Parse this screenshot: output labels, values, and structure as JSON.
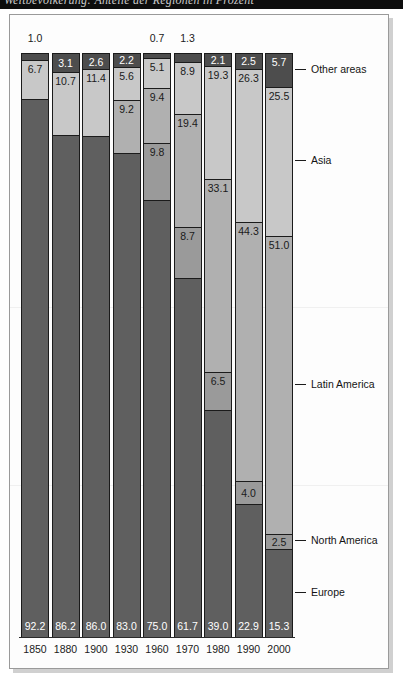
{
  "top_banner": {
    "partial_text": "Weltbevölkerung: Anteile der Regionen in Prozent"
  },
  "chart_data": {
    "type": "bar",
    "subtype": "stacked-bar-100-percent",
    "title": "",
    "xlabel": "",
    "ylabel": "",
    "ylim": [
      0,
      100
    ],
    "grid": false,
    "legend_position": "right-callouts",
    "categories": [
      "1850",
      "1880",
      "1900",
      "1930",
      "1960",
      "1970",
      "1980",
      "1990",
      "2000"
    ],
    "series": [
      {
        "name": "Other areas",
        "color": "#4d4d4d",
        "values": [
          1.0,
          3.1,
          2.6,
          2.2,
          0.7,
          1.3,
          2.1,
          2.5,
          5.7
        ]
      },
      {
        "name": "Asia",
        "color": "#c8c8c8",
        "values": [
          6.7,
          10.7,
          11.4,
          5.6,
          5.1,
          8.9,
          19.3,
          26.3,
          25.5
        ]
      },
      {
        "name": "Latin America",
        "color": "#b0b0b0",
        "values": [
          0.0,
          0.0,
          0.0,
          9.2,
          9.4,
          19.4,
          33.1,
          44.3,
          51.0
        ]
      },
      {
        "name": "North America",
        "color": "#9a9a9a",
        "values": [
          0.0,
          0.0,
          0.0,
          0.0,
          9.8,
          8.7,
          6.5,
          4.0,
          2.5
        ]
      },
      {
        "name": "Europe",
        "color": "#5f5f5f",
        "values": [
          92.2,
          86.2,
          86.0,
          83.0,
          75.0,
          61.7,
          39.0,
          22.9,
          15.3
        ]
      }
    ],
    "legend_entries": [
      {
        "label": "Other areas",
        "value": "5.7"
      },
      {
        "label": "Asia",
        "value": "25.5"
      },
      {
        "label": "Latin America",
        "value": "51.0"
      },
      {
        "label": "North America",
        "value": "2.5"
      },
      {
        "label": "Europe",
        "value": "15.3"
      }
    ],
    "bars": [
      {
        "year": "1850",
        "segments": [
          {
            "region": "Other areas",
            "value": 1.0,
            "label": "1.0",
            "shown": "above"
          },
          {
            "region": "Asia",
            "value": 6.7,
            "label": "6.7",
            "shown": "inside"
          },
          {
            "region": "Europe",
            "value": 92.2,
            "label": "92.2",
            "shown": "bottom"
          }
        ]
      },
      {
        "year": "1880",
        "segments": [
          {
            "region": "Other areas",
            "value": 3.1,
            "label": "3.1",
            "shown": "inside"
          },
          {
            "region": "Asia",
            "value": 10.7,
            "label": "10.7",
            "shown": "inside"
          },
          {
            "region": "Europe",
            "value": 86.2,
            "label": "86.2",
            "shown": "bottom"
          }
        ]
      },
      {
        "year": "1900",
        "segments": [
          {
            "region": "Other areas",
            "value": 2.6,
            "label": "2.6",
            "shown": "inside"
          },
          {
            "region": "Asia",
            "value": 11.4,
            "label": "11.4",
            "shown": "inside"
          },
          {
            "region": "Europe",
            "value": 86.0,
            "label": "86.0",
            "shown": "bottom"
          }
        ]
      },
      {
        "year": "1930",
        "segments": [
          {
            "region": "Other areas",
            "value": 2.2,
            "label": "2.2",
            "shown": "inside"
          },
          {
            "region": "Asia",
            "value": 5.6,
            "label": "5.6",
            "shown": "inside"
          },
          {
            "region": "Latin America",
            "value": 9.2,
            "label": "9.2",
            "shown": "inside"
          },
          {
            "region": "Europe",
            "value": 83.0,
            "label": "83.0",
            "shown": "bottom"
          }
        ]
      },
      {
        "year": "1960",
        "segments": [
          {
            "region": "Other areas",
            "value": 0.7,
            "label": "0.7",
            "shown": "above"
          },
          {
            "region": "Asia",
            "value": 5.1,
            "label": "5.1",
            "shown": "inside"
          },
          {
            "region": "Latin America",
            "value": 9.4,
            "label": "9.4",
            "shown": "inside"
          },
          {
            "region": "North America",
            "value": 9.8,
            "label": "9.8",
            "shown": "inside"
          },
          {
            "region": "Europe",
            "value": 75.0,
            "label": "75.0",
            "shown": "bottom"
          }
        ]
      },
      {
        "year": "1970",
        "segments": [
          {
            "region": "Other areas",
            "value": 1.3,
            "label": "1.3",
            "shown": "above"
          },
          {
            "region": "Asia",
            "value": 8.9,
            "label": "8.9",
            "shown": "inside"
          },
          {
            "region": "Latin America",
            "value": 19.4,
            "label": "19.4",
            "shown": "inside"
          },
          {
            "region": "North America",
            "value": 8.7,
            "label": "8.7",
            "shown": "inside"
          },
          {
            "region": "Europe",
            "value": 61.7,
            "label": "61.7",
            "shown": "bottom"
          }
        ]
      },
      {
        "year": "1980",
        "segments": [
          {
            "region": "Other areas",
            "value": 2.1,
            "label": "2.1",
            "shown": "inside"
          },
          {
            "region": "Asia",
            "value": 19.3,
            "label": "19.3",
            "shown": "inside"
          },
          {
            "region": "Latin America",
            "value": 33.1,
            "label": "33.1",
            "shown": "inside"
          },
          {
            "region": "North America",
            "value": 6.5,
            "label": "6.5",
            "shown": "inside"
          },
          {
            "region": "Europe",
            "value": 39.0,
            "label": "39.0",
            "shown": "bottom"
          }
        ]
      },
      {
        "year": "1990",
        "segments": [
          {
            "region": "Other areas",
            "value": 2.5,
            "label": "2.5",
            "shown": "inside"
          },
          {
            "region": "Asia",
            "value": 26.3,
            "label": "26.3",
            "shown": "inside"
          },
          {
            "region": "Latin America",
            "value": 44.3,
            "label": "44.3",
            "shown": "inside"
          },
          {
            "region": "North America",
            "value": 4.0,
            "label": "4.0",
            "shown": "inside"
          },
          {
            "region": "Europe",
            "value": 22.9,
            "label": "22.9",
            "shown": "bottom"
          }
        ]
      },
      {
        "year": "2000",
        "segments": [
          {
            "region": "Other areas",
            "value": 5.7,
            "label": "5.7",
            "shown": "inside"
          },
          {
            "region": "Asia",
            "value": 25.5,
            "label": "25.5",
            "shown": "inside"
          },
          {
            "region": "Latin America",
            "value": 51.0,
            "label": "51.0",
            "shown": "inside"
          },
          {
            "region": "North America",
            "value": 2.5,
            "label": "2.5",
            "shown": "inside"
          },
          {
            "region": "Europe",
            "value": 15.3,
            "label": "15.3",
            "shown": "bottom"
          }
        ]
      }
    ]
  },
  "colors": {
    "other_areas": "#4d4d4d",
    "asia": "#c8c8c8",
    "latin_america": "#b0b0b0",
    "north_america": "#9a9a9a",
    "europe": "#5f5f5f",
    "panel_border": "#9a9a9a",
    "bar_outline": "#1b1b1b",
    "text": "#141414"
  }
}
